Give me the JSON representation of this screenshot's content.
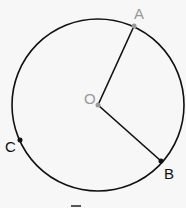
{
  "diagram": {
    "title": "",
    "circle": {
      "cx": 98,
      "cy": 105,
      "r": 86,
      "stroke": "#111111"
    },
    "points": {
      "A": {
        "label": "A",
        "x": 134,
        "y": 26,
        "color": "#999999"
      },
      "O": {
        "label": "O",
        "x": 98,
        "y": 105,
        "color": "#999999"
      },
      "B": {
        "label": "B",
        "x": 161,
        "y": 161,
        "color": "#111111"
      },
      "C": {
        "label": "C",
        "x": 20,
        "y": 140,
        "color": "#111111"
      }
    },
    "segments": [
      {
        "from": "O",
        "to": "A"
      },
      {
        "from": "O",
        "to": "B"
      }
    ]
  }
}
